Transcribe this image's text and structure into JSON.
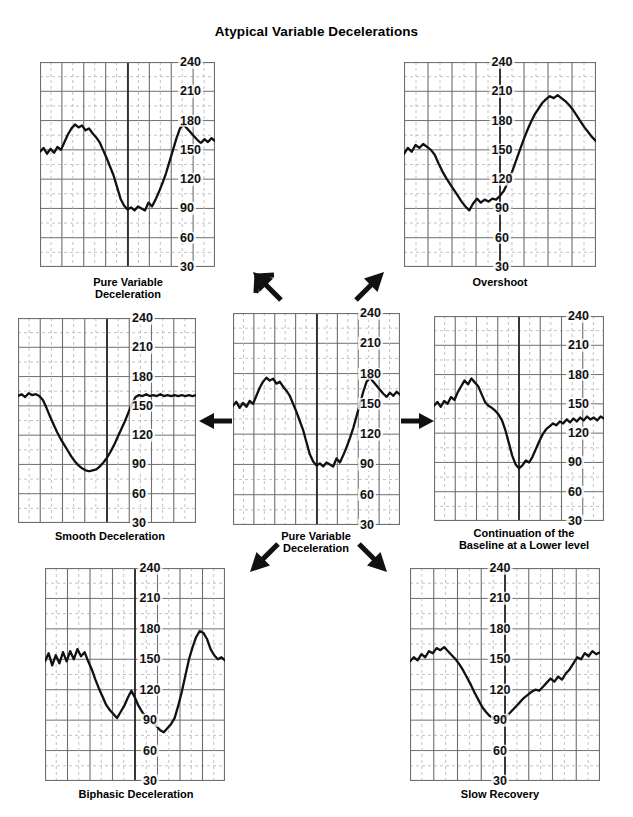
{
  "figure": {
    "title": "Atypical Variable Decelerations",
    "bottom_cutoff_text": "",
    "ink_color": "#111111",
    "grid_major_color": "#6f6f72",
    "grid_minor_color": "#b4b4b8",
    "background": "#ffffff"
  },
  "axis": {
    "ticks": [
      240,
      210,
      180,
      150,
      120,
      90,
      60,
      30
    ],
    "ymin": 30,
    "ymax": 240,
    "units": "bpm"
  },
  "arrows": [
    {
      "name": "arrow-to-loss-of-shoulder",
      "direction": "up-left"
    },
    {
      "name": "arrow-to-overshoot",
      "direction": "up-right"
    },
    {
      "name": "arrow-to-smooth-deceleration",
      "direction": "left"
    },
    {
      "name": "arrow-to-continuation-lower-baseline",
      "direction": "right"
    },
    {
      "name": "arrow-to-biphasic-deceleration",
      "direction": "down-left"
    },
    {
      "name": "arrow-to-slow-recovery",
      "direction": "down-right"
    }
  ],
  "chart_data": [
    {
      "id": "pure-variable",
      "type": "line",
      "title": "Pure Variable\nDeceleration",
      "xlabel": "",
      "ylabel": "FHR (bpm)",
      "ylim": [
        30,
        240
      ],
      "grid": true,
      "legend": "none",
      "x": [
        0,
        2,
        4,
        6,
        8,
        10,
        12,
        14,
        16,
        18,
        20,
        22,
        24,
        26,
        28,
        30,
        32,
        34,
        36,
        38,
        40,
        42,
        44,
        46,
        48,
        50,
        52,
        54,
        56,
        58,
        60,
        62,
        64,
        66,
        68,
        70,
        72,
        74,
        76,
        78,
        80,
        82,
        84,
        86,
        88,
        90,
        92,
        94,
        96,
        98,
        100
      ],
      "values": [
        148,
        152,
        146,
        151,
        147,
        153,
        150,
        158,
        166,
        172,
        176,
        173,
        175,
        170,
        172,
        167,
        163,
        158,
        150,
        142,
        133,
        124,
        112,
        100,
        93,
        89,
        91,
        88,
        92,
        90,
        88,
        96,
        92,
        99,
        107,
        116,
        126,
        138,
        150,
        162,
        172,
        176,
        172,
        168,
        164,
        160,
        157,
        161,
        158,
        162,
        159
      ]
    },
    {
      "id": "loss-of-shoulder",
      "type": "line",
      "title": "Loss of Initial and\nSecondary “Shoulder”",
      "xlabel": "",
      "ylabel": "FHR (bpm)",
      "ylim": [
        30,
        240
      ],
      "grid": true,
      "legend": "none",
      "x": [
        0,
        2,
        4,
        6,
        8,
        10,
        12,
        14,
        16,
        18,
        20,
        22,
        24,
        26,
        28,
        30,
        32,
        34,
        36,
        38,
        40,
        42,
        44,
        46,
        48,
        50,
        52,
        54,
        56,
        58,
        60,
        62,
        64,
        66,
        68,
        70,
        72,
        74,
        76,
        78,
        80,
        82,
        84,
        86,
        88,
        90,
        92,
        94,
        96,
        98,
        100
      ],
      "values": [
        159,
        160,
        158,
        161,
        159,
        162,
        160,
        161,
        159,
        155,
        146,
        137,
        130,
        124,
        119,
        113,
        107,
        101,
        96,
        91,
        87,
        85,
        84,
        85,
        84,
        86,
        85,
        84,
        85,
        84,
        85,
        86,
        88,
        95,
        108,
        124,
        140,
        148,
        141,
        150,
        156,
        152,
        158,
        155,
        160,
        157,
        154,
        159,
        157,
        160,
        159
      ]
    },
    {
      "id": "overshoot",
      "type": "line",
      "title": "Overshoot",
      "xlabel": "",
      "ylabel": "FHR (bpm)",
      "ylim": [
        30,
        240
      ],
      "grid": true,
      "legend": "none",
      "x": [
        0,
        2,
        4,
        6,
        8,
        10,
        12,
        14,
        16,
        18,
        20,
        22,
        24,
        26,
        28,
        30,
        32,
        34,
        36,
        38,
        40,
        42,
        44,
        46,
        48,
        50,
        52,
        54,
        56,
        58,
        60,
        62,
        64,
        66,
        68,
        70,
        72,
        74,
        76,
        78,
        80,
        82,
        84,
        86,
        88,
        90,
        92,
        94,
        96,
        98,
        100
      ],
      "values": [
        146,
        152,
        148,
        155,
        152,
        156,
        153,
        150,
        145,
        136,
        128,
        121,
        115,
        109,
        103,
        97,
        92,
        88,
        95,
        100,
        96,
        99,
        97,
        100,
        99,
        103,
        108,
        116,
        126,
        137,
        148,
        159,
        169,
        178,
        186,
        192,
        198,
        202,
        205,
        203,
        206,
        203,
        200,
        196,
        191,
        185,
        179,
        173,
        168,
        163,
        159
      ]
    },
    {
      "id": "smooth-deceleration",
      "type": "line",
      "title": "Smooth Deceleration",
      "xlabel": "",
      "ylabel": "FHR (bpm)",
      "ylim": [
        30,
        240
      ],
      "grid": true,
      "legend": "none",
      "x": [
        0,
        2,
        4,
        6,
        8,
        10,
        12,
        14,
        16,
        18,
        20,
        22,
        24,
        26,
        28,
        30,
        32,
        34,
        36,
        38,
        40,
        42,
        44,
        46,
        48,
        50,
        52,
        54,
        56,
        58,
        60,
        62,
        64,
        66,
        68,
        70,
        72,
        74,
        76,
        78,
        80,
        82,
        84,
        86,
        88,
        90,
        92,
        94,
        96,
        98,
        100
      ],
      "values": [
        160,
        162,
        159,
        163,
        161,
        162,
        160,
        156,
        148,
        139,
        131,
        123,
        116,
        110,
        104,
        98,
        93,
        89,
        86,
        84,
        83,
        84,
        85,
        88,
        92,
        97,
        103,
        110,
        118,
        126,
        134,
        143,
        152,
        159,
        161,
        160,
        162,
        160,
        161,
        160,
        162,
        160,
        161,
        160,
        161,
        160,
        161,
        160,
        161,
        160,
        161
      ]
    },
    {
      "id": "continuation-lower-baseline",
      "type": "line",
      "title": "Continuation of the\nBaseline at a Lower level",
      "xlabel": "",
      "ylabel": "FHR (bpm)",
      "ylim": [
        30,
        240
      ],
      "grid": true,
      "legend": "none",
      "x": [
        0,
        2,
        4,
        6,
        8,
        10,
        12,
        14,
        16,
        18,
        20,
        22,
        24,
        26,
        28,
        30,
        32,
        34,
        36,
        38,
        40,
        42,
        44,
        46,
        48,
        50,
        52,
        54,
        56,
        58,
        60,
        62,
        64,
        66,
        68,
        70,
        72,
        74,
        76,
        78,
        80,
        82,
        84,
        86,
        88,
        90,
        92,
        94,
        96,
        98,
        100
      ],
      "values": [
        148,
        152,
        147,
        153,
        150,
        157,
        154,
        162,
        168,
        174,
        170,
        176,
        172,
        168,
        160,
        152,
        148,
        146,
        143,
        139,
        133,
        123,
        110,
        97,
        88,
        84,
        87,
        92,
        90,
        96,
        104,
        112,
        119,
        124,
        127,
        130,
        128,
        132,
        130,
        134,
        131,
        135,
        132,
        136,
        133,
        137,
        134,
        136,
        133,
        137,
        135
      ]
    },
    {
      "id": "biphasic-deceleration",
      "type": "line",
      "title": "Biphasic Deceleration",
      "xlabel": "",
      "ylabel": "FHR (bpm)",
      "ylim": [
        30,
        240
      ],
      "grid": true,
      "legend": "none",
      "x": [
        0,
        2,
        4,
        6,
        8,
        10,
        12,
        14,
        16,
        18,
        20,
        22,
        24,
        26,
        28,
        30,
        32,
        34,
        36,
        38,
        40,
        42,
        44,
        46,
        48,
        50,
        52,
        54,
        56,
        58,
        60,
        62,
        64,
        66,
        68,
        70,
        72,
        74,
        76,
        78,
        80,
        82,
        84,
        86,
        88,
        90,
        92,
        94,
        96,
        98,
        100
      ],
      "values": [
        148,
        156,
        144,
        154,
        146,
        157,
        148,
        158,
        150,
        160,
        153,
        157,
        148,
        140,
        130,
        121,
        113,
        105,
        100,
        96,
        92,
        98,
        104,
        112,
        119,
        112,
        104,
        98,
        93,
        90,
        88,
        84,
        80,
        78,
        82,
        86,
        92,
        104,
        118,
        134,
        150,
        162,
        172,
        178,
        176,
        170,
        160,
        154,
        150,
        152,
        149,
        151
      ]
    },
    {
      "id": "slow-recovery",
      "type": "line",
      "title": "Slow Recovery",
      "xlabel": "",
      "ylabel": "FHR (bpm)",
      "ylim": [
        30,
        240
      ],
      "grid": true,
      "legend": "none",
      "x": [
        0,
        2,
        4,
        6,
        8,
        10,
        12,
        14,
        16,
        18,
        20,
        22,
        24,
        26,
        28,
        30,
        32,
        34,
        36,
        38,
        40,
        42,
        44,
        46,
        48,
        50,
        52,
        54,
        56,
        58,
        60,
        62,
        64,
        66,
        68,
        70,
        72,
        74,
        76,
        78,
        80,
        82,
        84,
        86,
        88,
        90,
        92,
        94,
        96,
        98,
        100
      ],
      "values": [
        148,
        152,
        149,
        155,
        152,
        158,
        156,
        161,
        159,
        162,
        158,
        154,
        150,
        145,
        139,
        132,
        125,
        117,
        110,
        103,
        98,
        94,
        92,
        90,
        91,
        93,
        96,
        100,
        104,
        108,
        112,
        115,
        118,
        120,
        119,
        123,
        127,
        131,
        128,
        133,
        130,
        136,
        140,
        146,
        152,
        150,
        156,
        153,
        158,
        155,
        157
      ]
    }
  ]
}
